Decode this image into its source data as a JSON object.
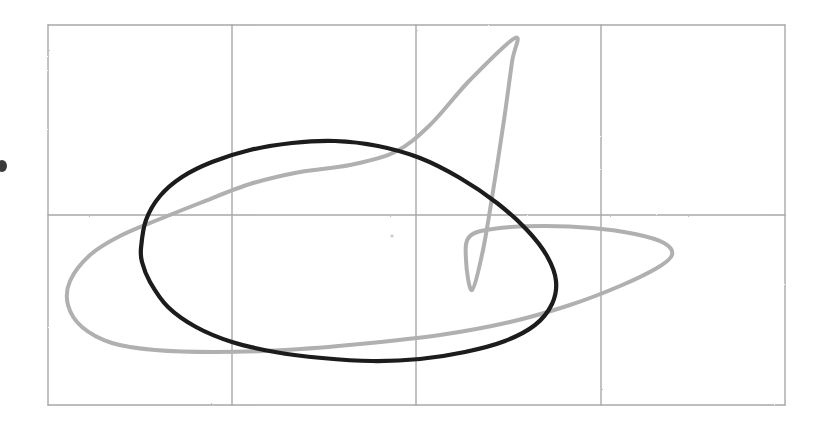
{
  "figure": {
    "background_color": "#ffffff",
    "width": 822,
    "height": 429,
    "style_note": "hand-drawn / scanned pencil line quality"
  },
  "grid": {
    "name": "plot-grid",
    "color": "#a8a8a8",
    "stroke_width": 1.4,
    "bounds": {
      "left": 48,
      "top": 25,
      "right": 785,
      "bottom": 405
    },
    "vertical_lines_x": [
      48,
      232,
      416,
      601,
      785
    ],
    "horizontal_lines_y": [
      25,
      215,
      405
    ],
    "columns": 4,
    "rows": 2,
    "tick_labels_visible": false,
    "axis_labels_visible": false
  },
  "chart_data": {
    "type": "line",
    "subtitle": "",
    "xlabel": "",
    "ylabel": "",
    "xlim": [
      48,
      785
    ],
    "ylim": [
      405,
      25
    ],
    "grid": true,
    "legend_position": "none",
    "series": [
      {
        "name": "outer-cusped-curve",
        "color": "#b0b0b0",
        "stroke_width": 4.0,
        "closed": true,
        "description": "Larger light-gray closed curve with a sharp upward cusp near the upper right and a pointed tail extending to the right",
        "extents": {
          "leftmost_x": 65,
          "rightmost_x": 673,
          "topmost_y": 37,
          "bottommost_y": 353
        },
        "key_points": [
          [
            515,
            38
          ],
          [
            470,
            80
          ],
          [
            430,
            125
          ],
          [
            395,
            152
          ],
          [
            350,
            165
          ],
          [
            300,
            172
          ],
          [
            250,
            184
          ],
          [
            200,
            203
          ],
          [
            160,
            219
          ],
          [
            120,
            236
          ],
          [
            90,
            255
          ],
          [
            70,
            281
          ],
          [
            68,
            305
          ],
          [
            82,
            327
          ],
          [
            112,
            343
          ],
          [
            155,
            350
          ],
          [
            215,
            352
          ],
          [
            285,
            350
          ],
          [
            360,
            344
          ],
          [
            440,
            335
          ],
          [
            510,
            322
          ],
          [
            570,
            305
          ],
          [
            620,
            286
          ],
          [
            657,
            268
          ],
          [
            672,
            255
          ],
          [
            664,
            243
          ],
          [
            635,
            234
          ],
          [
            592,
            228
          ],
          [
            545,
            226
          ],
          [
            500,
            228
          ],
          [
            470,
            236
          ],
          [
            466,
            260
          ],
          [
            472,
            290
          ],
          [
            483,
            250
          ],
          [
            494,
            185
          ],
          [
            504,
            120
          ],
          [
            512,
            62
          ]
        ]
      },
      {
        "name": "inner-oval-curve",
        "color": "#1a1a1a",
        "stroke_width": 4.2,
        "closed": true,
        "description": "Darker, smaller egg-shaped closed oval centered in the grid",
        "extents": {
          "leftmost_x": 141,
          "rightmost_x": 557,
          "topmost_y": 141,
          "bottommost_y": 361
        },
        "key_points": [
          [
            141,
            248
          ],
          [
            146,
            220
          ],
          [
            160,
            196
          ],
          [
            182,
            177
          ],
          [
            212,
            162
          ],
          [
            250,
            150
          ],
          [
            292,
            143
          ],
          [
            335,
            141
          ],
          [
            378,
            146
          ],
          [
            420,
            158
          ],
          [
            460,
            178
          ],
          [
            497,
            203
          ],
          [
            527,
            230
          ],
          [
            547,
            256
          ],
          [
            556,
            281
          ],
          [
            552,
            304
          ],
          [
            535,
            325
          ],
          [
            505,
            341
          ],
          [
            465,
            352
          ],
          [
            420,
            359
          ],
          [
            372,
            361
          ],
          [
            322,
            358
          ],
          [
            275,
            352
          ],
          [
            232,
            342
          ],
          [
            196,
            327
          ],
          [
            168,
            307
          ],
          [
            150,
            282
          ],
          [
            142,
            262
          ]
        ]
      }
    ]
  },
  "markers": [
    {
      "name": "left-edge-dot",
      "description": "small dark mark partially cut off at the far left edge",
      "color": "#3a3a3a",
      "cx": 2,
      "cy": 166,
      "rx": 5,
      "ry": 6
    },
    {
      "name": "center-speck",
      "description": "faint speck near the center of the plot area",
      "color": "#c9c9c9",
      "cx": 392,
      "cy": 236,
      "rx": 1.6,
      "ry": 1.6
    }
  ],
  "annotations": {
    "text_items": [],
    "note": "No visible text, tick labels, legend, or axis titles in this figure."
  }
}
